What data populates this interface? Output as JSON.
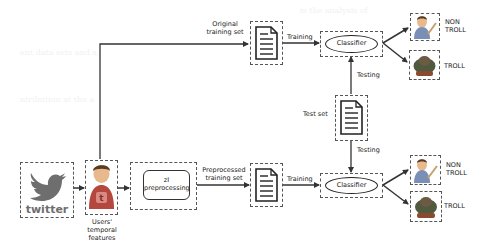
{
  "diagram": {
    "type": "flowchart",
    "nodes": {
      "twitter": {
        "label": "twitter",
        "icon": "twitter-bird-logo"
      },
      "users": {
        "label": "Users' temporal features",
        "lines": [
          "Users'",
          "temporal",
          "features"
        ],
        "icon": "user-avatar-twitter"
      },
      "preprocessing": {
        "lines": [
          "zI",
          "preprocessing"
        ]
      },
      "original_doc": {
        "icon": "document-icon"
      },
      "preprocessed_doc": {
        "icon": "document-icon"
      },
      "test_doc": {
        "icon": "document-icon"
      },
      "classifier_top": {
        "label": "Classifier"
      },
      "classifier_bottom": {
        "label": "Classifier"
      },
      "out_top_nontroll": {
        "lines": [
          "NON",
          "TROLL"
        ],
        "icon": "nontroll-avatar"
      },
      "out_top_troll": {
        "label": "TROLL",
        "icon": "troll-avatar"
      },
      "out_bottom_nontroll": {
        "lines": [
          "NON",
          "TROLL"
        ],
        "icon": "nontroll-avatar"
      },
      "out_bottom_troll": {
        "label": "TROLL",
        "icon": "troll-avatar"
      }
    },
    "edges": {
      "original_training_set": {
        "lines": [
          "Original",
          "training set"
        ]
      },
      "preprocessed_training_set": {
        "lines": [
          "Preprocessed",
          "training set"
        ]
      },
      "training_top": {
        "label": "Training"
      },
      "training_bottom": {
        "label": "Training"
      },
      "testing_top": {
        "label": "Testing"
      },
      "testing_bottom": {
        "label": "Testing"
      },
      "test_set": {
        "label": "Test set"
      }
    },
    "colors": {
      "line": "#333333",
      "dash": "#555555",
      "twitter_gray": "#6e6e6e",
      "avatar_red": "#b5483e",
      "hair": "#5a3a22",
      "skin": "#e7b98c"
    }
  }
}
